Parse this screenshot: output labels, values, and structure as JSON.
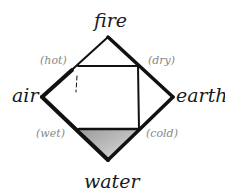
{
  "diagram": {
    "elements": {
      "top": "fire",
      "left": "air",
      "right": "earth",
      "bottom": "water"
    },
    "qualities": {
      "top_left": "(hot)",
      "top_right": "(dry)",
      "bottom_left": "(wet)",
      "bottom_right": "(cold)"
    },
    "colors": {
      "stroke": "#111111",
      "quality_text": "#888888",
      "shade": "#bdbdbd"
    }
  }
}
